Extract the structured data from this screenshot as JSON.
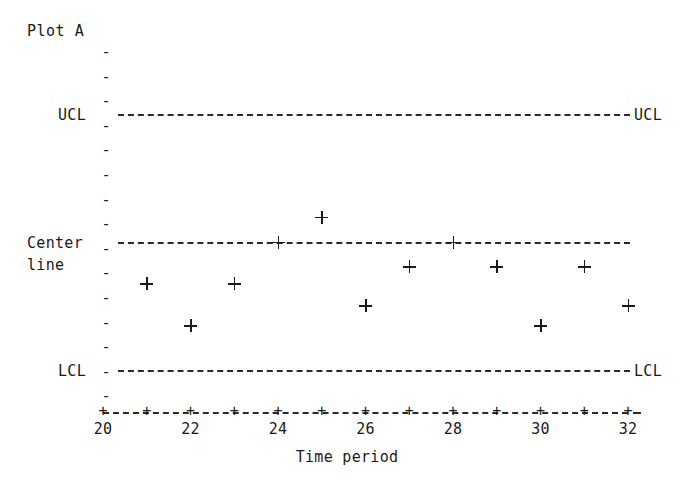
{
  "title": "Plot A",
  "axis": {
    "x_title": "Time period",
    "x_tick_labels": [
      "20",
      "22",
      "24",
      "26",
      "28",
      "30",
      "32"
    ],
    "y_labels": {
      "ucl_left": "UCL",
      "ucl_right": "UCL",
      "center_left_line1": "Center",
      "center_left_line2": "line",
      "lcl_left": "LCL",
      "lcl_right": "LCL"
    }
  },
  "chart_data": {
    "type": "scatter",
    "title": "Plot A",
    "xlabel": "Time period",
    "ylabel": "",
    "xlim": [
      20,
      32
    ],
    "ylim": [
      -5.2,
      5.2
    ],
    "grid": false,
    "legend_position": "none",
    "marker": "+",
    "x": [
      20,
      21,
      22,
      23,
      24,
      25,
      26,
      27,
      28,
      29,
      30,
      31,
      32
    ],
    "values": [
      -1,
      -1.7,
      -3.4,
      -1.7,
      0,
      1,
      -2.6,
      -1,
      0,
      -1,
      -3.4,
      -1,
      -2.6
    ],
    "x_ticks": [
      20,
      21,
      22,
      23,
      24,
      25,
      26,
      27,
      28,
      29,
      30,
      31,
      32
    ],
    "x_tick_labels_shown": [
      20,
      22,
      24,
      26,
      28,
      30,
      32
    ],
    "reference_lines": [
      {
        "name": "UCL",
        "label": "UCL",
        "value": 5.2,
        "style": "dashed"
      },
      {
        "name": "Center line",
        "label": "Center line",
        "value": 0,
        "style": "dashed"
      },
      {
        "name": "LCL",
        "label": "LCL",
        "value": -5.2,
        "style": "dashed"
      }
    ],
    "points_on_center_line": [
      24,
      28
    ],
    "points_outside_limits": []
  }
}
